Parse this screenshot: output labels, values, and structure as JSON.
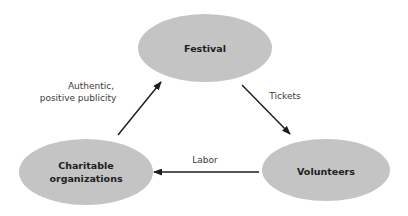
{
  "diagram": {
    "type": "cycle-relationship-diagram",
    "background_color": "#ffffff",
    "node_fill_color": "#c4c4c4",
    "node_text_color": "#1d1d1d",
    "edge_color": "#1d1d1d",
    "edge_label_color": "#3b3b3b",
    "nodes": [
      {
        "id": "festival",
        "label": "Festival",
        "lines": [
          "Festival"
        ],
        "cx": 205,
        "cy": 48,
        "rx": 67,
        "ry": 34
      },
      {
        "id": "charitable-organizations",
        "label": "Charitable organizations",
        "lines": [
          "Charitable",
          "organizations"
        ],
        "cx": 86,
        "cy": 172,
        "rx": 67,
        "ry": 33
      },
      {
        "id": "volunteers",
        "label": "Volunteers",
        "lines": [
          "Volunteers"
        ],
        "cx": 326,
        "cy": 170,
        "rx": 64,
        "ry": 31
      }
    ],
    "edges": [
      {
        "id": "festival-to-volunteers",
        "label": "Tickets",
        "lines": [
          "Tickets"
        ],
        "from": "festival",
        "to": "volunteers",
        "x1": 242,
        "y1": 85,
        "x2": 290,
        "y2": 134,
        "label_x": 285,
        "label_y": 96
      },
      {
        "id": "volunteers-to-charitable-organizations",
        "label": "Labor",
        "lines": [
          "Labor"
        ],
        "from": "volunteers",
        "to": "charitable-organizations",
        "x1": 259,
        "y1": 172,
        "x2": 154,
        "y2": 172,
        "label_x": 205,
        "label_y": 160
      },
      {
        "id": "charitable-organizations-to-festival",
        "label": "Authentic, positive publicity",
        "lines": [
          "Authentic,",
          "positive publicity"
        ],
        "from": "charitable-organizations",
        "to": "festival",
        "x1": 118,
        "y1": 135,
        "x2": 161,
        "y2": 82,
        "label_x": 91,
        "label_y": 92
      }
    ]
  }
}
